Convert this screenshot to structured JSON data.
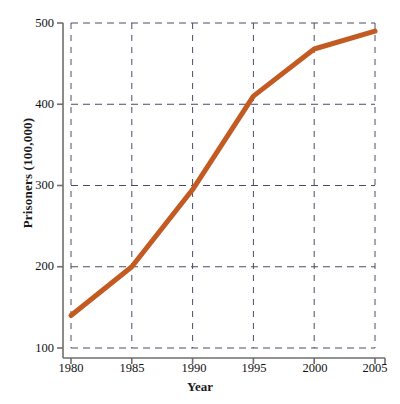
{
  "chart_data": {
    "type": "line",
    "title": "",
    "xlabel": "Year",
    "ylabel": "Prisoners (100,000)",
    "x": [
      1980,
      1985,
      1990,
      1995,
      2000,
      2005
    ],
    "values": [
      140,
      200,
      295,
      410,
      468,
      490
    ],
    "series": [
      {
        "name": "Prisoners",
        "values": [
          140,
          200,
          295,
          410,
          468,
          490
        ],
        "color": "#C25A22"
      }
    ],
    "xticks": [
      "1980",
      "1985",
      "1990",
      "1995",
      "2000",
      "2005"
    ],
    "yticks": [
      "100",
      "200",
      "300",
      "400",
      "500"
    ],
    "xlim": [
      1980,
      2005
    ],
    "ylim": [
      100,
      500
    ],
    "grid": true,
    "grid_style": "dashed",
    "legend": "none",
    "line_color": "#C25A22",
    "line_width": 5,
    "axis_color": "#6e6e6e",
    "grid_color": "#4a4a66",
    "background": "#ffffff"
  }
}
